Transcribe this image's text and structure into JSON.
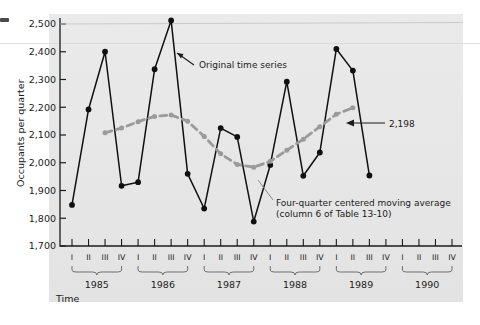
{
  "figure": {
    "background": "#ffffff",
    "panel_color": "#e8e8e8",
    "series_original_color": "#101010",
    "series_ma_color": "#9a9a9a"
  },
  "chart_data": {
    "type": "line",
    "title": "",
    "xlabel": "Time",
    "ylabel": "Occupants per quarter",
    "ylim": [
      1700,
      2500
    ],
    "yticks": [
      1700,
      1800,
      1900,
      2000,
      2100,
      2200,
      2300,
      2400,
      2500
    ],
    "ytick_labels": [
      "1,700",
      "1,800",
      "1,900",
      "2,000",
      "2,100",
      "2,200",
      "2,300",
      "2,400",
      "2,500"
    ],
    "grid": false,
    "legend_position": "annotations",
    "quarters": [
      "I",
      "II",
      "III",
      "IV"
    ],
    "years": [
      "1985",
      "1986",
      "1987",
      "1988",
      "1989",
      "1990"
    ],
    "x": [
      "1985 I",
      "1985 II",
      "1985 III",
      "1985 IV",
      "1986 I",
      "1986 II",
      "1986 III",
      "1986 IV",
      "1987 I",
      "1987 II",
      "1987 III",
      "1987 IV",
      "1988 I",
      "1988 II",
      "1988 III",
      "1988 IV",
      "1989 I",
      "1989 II",
      "1989 III",
      "1989 IV",
      "1990 I",
      "1990 II",
      "1990 III",
      "1990 IV"
    ],
    "series": [
      {
        "name": "Original time series",
        "color": "#101010",
        "style": "solid",
        "marker": "circle",
        "values": [
          1848,
          2192,
          2400,
          1917,
          1930,
          2337,
          2513,
          1960,
          1835,
          2125,
          2093,
          1788,
          1992,
          2292,
          1953,
          2037,
          2410,
          2332,
          1954,
          null,
          null,
          null,
          null,
          null
        ]
      },
      {
        "name": "Four-quarter centered moving average",
        "color": "#9a9a9a",
        "style": "dashed",
        "marker": "circle",
        "note": "column 6 of Table 13-10",
        "values": [
          null,
          null,
          2108,
          2125,
          2148,
          2167,
          2172,
          2150,
          2095,
          2032,
          1994,
          1984,
          2005,
          2045,
          2085,
          2130,
          2175,
          2198,
          null,
          null,
          null,
          null,
          null,
          null
        ]
      }
    ],
    "annotations": [
      {
        "id": "original-series",
        "text": "Original time series",
        "target": "1986 III"
      },
      {
        "id": "moving-average",
        "text": "Four-quarter centered moving average",
        "text2": "(column 6 of Table 13-10)",
        "target": "1988 I"
      },
      {
        "id": "value-2198",
        "text": "2,198",
        "target": "1989 II",
        "value": 2198
      }
    ]
  }
}
